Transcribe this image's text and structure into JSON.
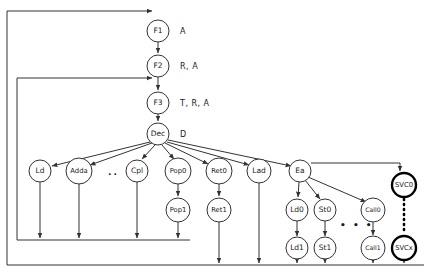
{
  "diagram": {
    "type": "flow-graph",
    "colors": {
      "stroke": "#333333",
      "node_fill": "#ffffff",
      "text": "#1a1a1a",
      "emphasis_stroke": "#000000"
    },
    "pipeline": [
      {
        "id": "f1",
        "label": "F1",
        "side_label": "A",
        "cx": 158,
        "cy": 31,
        "r": 11
      },
      {
        "id": "f2",
        "label": "F2",
        "side_label": "R, A",
        "cx": 158,
        "cy": 66,
        "r": 11
      },
      {
        "id": "f3",
        "label": "F3",
        "side_label": "T, R, A",
        "cx": 158,
        "cy": 103,
        "r": 11
      },
      {
        "id": "dec",
        "label": "Dec",
        "side_label": "D",
        "cx": 158,
        "cy": 134,
        "r": 11
      }
    ],
    "decode_row": [
      {
        "id": "ld",
        "label": "Ld",
        "cx": 40,
        "cy": 171,
        "r": 11
      },
      {
        "id": "adda",
        "label": "Adda",
        "cx": 79,
        "cy": 171,
        "r": 13
      },
      {
        "id": "cpl",
        "label": "Cpl",
        "cx": 137,
        "cy": 171,
        "r": 11
      },
      {
        "id": "pop0",
        "label": "Pop0",
        "cx": 178,
        "cy": 171,
        "r": 13
      },
      {
        "id": "ret0",
        "label": "Ret0",
        "cx": 219,
        "cy": 171,
        "r": 13
      },
      {
        "id": "lad",
        "label": "Lad",
        "cx": 259,
        "cy": 171,
        "r": 12
      },
      {
        "id": "ea",
        "label": "Ea",
        "cx": 300,
        "cy": 171,
        "r": 11
      }
    ],
    "decode_row_ellipsis": {
      "text": "..",
      "x": 108,
      "y": 175
    },
    "second_row": [
      {
        "id": "pop1",
        "label": "Pop1",
        "cx": 178,
        "cy": 210,
        "r": 12
      },
      {
        "id": "ret1",
        "label": "Ret1",
        "cx": 219,
        "cy": 210,
        "r": 12
      },
      {
        "id": "ld0",
        "label": "Ld0",
        "cx": 297,
        "cy": 210,
        "r": 11
      },
      {
        "id": "st0",
        "label": "St0",
        "cx": 325,
        "cy": 210,
        "r": 11
      },
      {
        "id": "call0",
        "label": "Call0",
        "cx": 373,
        "cy": 210,
        "r": 12
      }
    ],
    "third_row": [
      {
        "id": "ld1",
        "label": "Ld1",
        "cx": 297,
        "cy": 248,
        "r": 11
      },
      {
        "id": "st1",
        "label": "St1",
        "cx": 325,
        "cy": 248,
        "r": 11
      },
      {
        "id": "call1",
        "label": "Call1",
        "cx": 373,
        "cy": 248,
        "r": 12
      }
    ],
    "second_row_ellipsis": {
      "text": "• • •",
      "x": 340,
      "y": 228
    },
    "svc_chain": [
      {
        "id": "svc0",
        "label": "SVC0",
        "cx": 404,
        "cy": 185,
        "r": 12
      },
      {
        "id": "svcx",
        "label": "SVCx",
        "cx": 404,
        "cy": 248,
        "r": 12
      }
    ]
  }
}
